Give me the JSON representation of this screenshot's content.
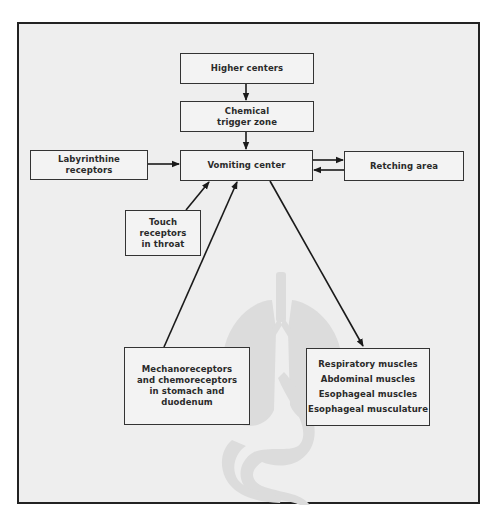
{
  "diagram": {
    "type": "flowchart",
    "colors": {
      "frame_border": "#222222",
      "background": "#eeeeee",
      "box_fill": "#f3f3f3",
      "box_border": "#333333",
      "silhouette": "#dcdcdc",
      "arrow": "#1a1a1a"
    },
    "nodes": {
      "higher_centers": {
        "lines": [
          "Higher centers"
        ]
      },
      "chemical_trigger_zone": {
        "lines": [
          "Chemical",
          "trigger zone"
        ]
      },
      "vomiting_center": {
        "lines": [
          "Vomiting center"
        ]
      },
      "labyrinthine_receptors": {
        "lines": [
          "Labyrinthine",
          "receptors"
        ]
      },
      "retching_area": {
        "lines": [
          "Retching area"
        ]
      },
      "touch_receptors": {
        "lines": [
          "Touch",
          "receptors",
          "in throat"
        ]
      },
      "mechanoreceptors": {
        "lines": [
          "Mechanoreceptors",
          "and chemoreceptors",
          "in stomach and",
          "duodenum"
        ]
      },
      "muscles": {
        "lines": [
          "Respiratory muscles",
          "Abdominal muscles",
          "Esophageal muscles",
          "Esophageal musculature"
        ]
      }
    },
    "edges": [
      {
        "from": "Higher centers",
        "to": "Chemical trigger zone"
      },
      {
        "from": "Chemical trigger zone",
        "to": "Vomiting center"
      },
      {
        "from": "Labyrinthine receptors",
        "to": "Vomiting center"
      },
      {
        "from": "Vomiting center",
        "to": "Retching area"
      },
      {
        "from": "Retching area",
        "to": "Vomiting center"
      },
      {
        "from": "Touch receptors in throat",
        "to": "Vomiting center"
      },
      {
        "from": "Mechanoreceptors and chemoreceptors in stomach and duodenum",
        "to": "Vomiting center"
      },
      {
        "from": "Vomiting center",
        "to": "Respiratory muscles / Abdominal muscles / Esophageal muscles / Esophageal musculature"
      }
    ],
    "background_figure": "anatomical silhouette: lungs, trachea, esophagus, stomach, duodenum"
  }
}
